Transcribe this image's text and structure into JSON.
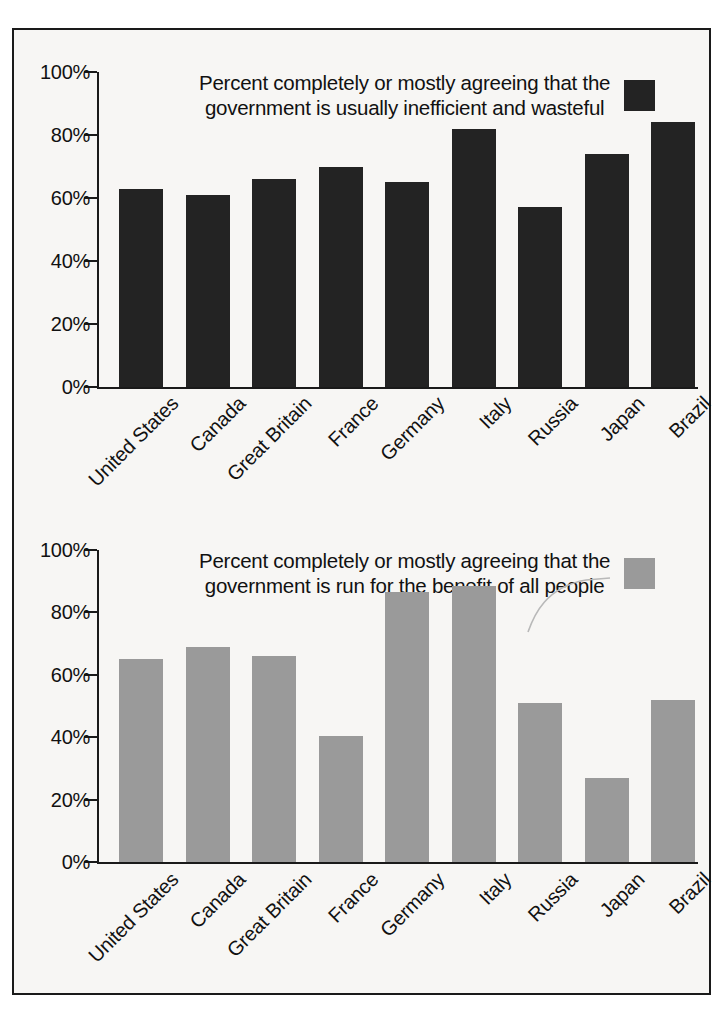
{
  "figure": {
    "border_color": "#1a1a1a",
    "background": "#f7f6f4"
  },
  "chart_data": [
    {
      "type": "bar",
      "title": "Percent completely or mostly agreeing that the government is usually inefficient and wasteful",
      "legend_label": "Percent completely or mostly agreeing that the government is usually inefficient and wasteful",
      "legend_line1": "Percent completely or mostly agreeing that the",
      "legend_line2": "government is usually inefficient and wasteful",
      "legend_position": "top-center",
      "series_color": "#232323",
      "xlabel": "",
      "ylabel": "",
      "ylim": [
        0,
        100
      ],
      "yticks": [
        0,
        20,
        40,
        60,
        80,
        100
      ],
      "ytick_labels": [
        "0%",
        "20%",
        "40%",
        "60%",
        "80%",
        "100%"
      ],
      "grid": false,
      "categories": [
        "United States",
        "Canada",
        "Great Britain",
        "France",
        "Germany",
        "Italy",
        "Russia",
        "Japan",
        "Brazil"
      ],
      "values": [
        63,
        61,
        66,
        70,
        65,
        82,
        57,
        74,
        84
      ]
    },
    {
      "type": "bar",
      "title": "Percent completely or mostly agreeing that the government is run for the benefit of all people",
      "legend_label": "Percent completely or mostly agreeing that the government is run for the benefit of all people",
      "legend_line1": "Percent completely or mostly agreeing that the",
      "legend_line2": "government is run for the benefit of all people",
      "legend_position": "top-center",
      "series_color": "#9a9a9a",
      "xlabel": "",
      "ylabel": "",
      "ylim": [
        0,
        100
      ],
      "yticks": [
        0,
        20,
        40,
        60,
        80,
        100
      ],
      "ytick_labels": [
        "0%",
        "20%",
        "40%",
        "60%",
        "80%",
        "100%"
      ],
      "grid": false,
      "categories": [
        "United States",
        "Canada",
        "Great Britain",
        "France",
        "Germany",
        "Italy",
        "Russia",
        "Japan",
        "Brazil"
      ],
      "values": [
        65,
        69,
        66,
        40.5,
        86.5,
        88.5,
        51,
        27,
        52
      ]
    }
  ]
}
